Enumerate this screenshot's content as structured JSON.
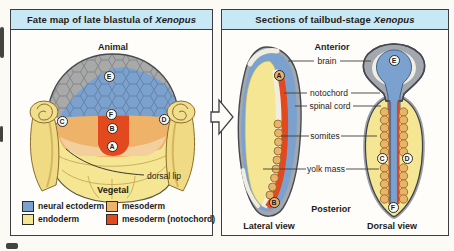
{
  "left_panel": {
    "title_prefix": "Fate map of late blastula of",
    "title_italic": "Xenopus",
    "animal_label": "Animal",
    "vegetal_label": "Vegetal",
    "dorsal_lip_label": "dorsal lip",
    "markers": {
      "a": "A",
      "b": "B",
      "c": "C",
      "d": "D",
      "e": "E",
      "f": "F"
    },
    "legend": [
      {
        "label": "neural ectoderm",
        "color": "#7ba2cf"
      },
      {
        "label": "endoderm",
        "color": "#f4e692"
      },
      {
        "label": "mesoderm",
        "color": "#eeb369"
      },
      {
        "label": "mesoderm (notochord)",
        "color": "#e2491f"
      }
    ]
  },
  "right_panel": {
    "title_prefix": "Sections of tailbud-stage",
    "title_italic": "Xenopus",
    "anterior_label": "Anterior",
    "posterior_label": "Posterior",
    "structure_labels": {
      "brain": "brain",
      "notochord": "notochord",
      "spinal_cord": "spinal cord",
      "somites": "somites",
      "yolk_mass": "yolk mass"
    },
    "lateral_caption": "Lateral view",
    "dorsal_caption": "Dorsal view",
    "markers": {
      "a": "A",
      "b": "B",
      "c": "C",
      "d": "D",
      "e": "E",
      "f": "F"
    }
  },
  "colors": {
    "header_bg": "#c9e8f6",
    "panel_border": "#3b3e42",
    "neural_blue": "#7ba2cf",
    "ectoderm_gray": "#a9aaa7",
    "endoderm_yellow": "#f4e692",
    "mesoderm_orange": "#eeb369",
    "notochord_red": "#e2491f"
  }
}
